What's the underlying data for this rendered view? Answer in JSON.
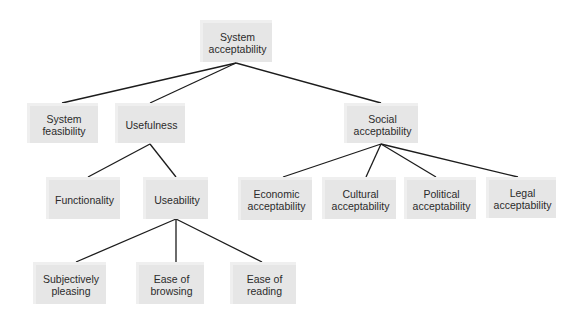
{
  "diagram": {
    "type": "tree",
    "colors": {
      "node_fill": "#e6e6e6",
      "node_highlight": "#efefef",
      "edge": "#1c1c1c",
      "text": "#2b2b2b"
    },
    "nodes": {
      "system_acceptability": {
        "label": "System\nacceptability",
        "x": 200,
        "y": 20,
        "w": 72,
        "h": 42
      },
      "system_feasibility": {
        "label": "System\nfeasibility",
        "x": 27,
        "y": 103,
        "w": 71,
        "h": 40
      },
      "usefulness": {
        "label": "Usefulness",
        "x": 115,
        "y": 103,
        "w": 70,
        "h": 40
      },
      "social_acceptability": {
        "label": "Social\nacceptability",
        "x": 344,
        "y": 103,
        "w": 74,
        "h": 40
      },
      "functionality": {
        "label": "Functionality",
        "x": 46,
        "y": 177,
        "w": 74,
        "h": 42
      },
      "useability": {
        "label": "Useability",
        "x": 143,
        "y": 177,
        "w": 65,
        "h": 42
      },
      "economic_acceptability": {
        "label": "Economic\nacceptability",
        "x": 238,
        "y": 177,
        "w": 74,
        "h": 43
      },
      "cultural_acceptability": {
        "label": "Cultural\nacceptability",
        "x": 322,
        "y": 177,
        "w": 74,
        "h": 42
      },
      "political_acceptability": {
        "label": "Political\nacceptability",
        "x": 404,
        "y": 177,
        "w": 72,
        "h": 42
      },
      "legal_acceptability": {
        "label": "Legal\nacceptability",
        "x": 486,
        "y": 177,
        "w": 70,
        "h": 41
      },
      "subjectively_pleasing": {
        "label": "Subjectively\npleasing",
        "x": 33,
        "y": 262,
        "w": 73,
        "h": 42
      },
      "ease_of_browsing": {
        "label": "Ease of\nbrowsing",
        "x": 136,
        "y": 262,
        "w": 68,
        "h": 42
      },
      "ease_of_reading": {
        "label": "Ease of\nreading",
        "x": 230,
        "y": 262,
        "w": 66,
        "h": 42
      }
    },
    "edges": [
      {
        "from": "system_acceptability",
        "to": "system_feasibility"
      },
      {
        "from": "system_acceptability",
        "to": "usefulness"
      },
      {
        "from": "system_acceptability",
        "to": "social_acceptability"
      },
      {
        "from": "usefulness",
        "to": "functionality"
      },
      {
        "from": "usefulness",
        "to": "useability"
      },
      {
        "from": "useability",
        "to": "subjectively_pleasing"
      },
      {
        "from": "useability",
        "to": "ease_of_browsing"
      },
      {
        "from": "useability",
        "to": "ease_of_reading"
      },
      {
        "from": "social_acceptability",
        "to": "economic_acceptability"
      },
      {
        "from": "social_acceptability",
        "to": "cultural_acceptability"
      },
      {
        "from": "social_acceptability",
        "to": "political_acceptability"
      },
      {
        "from": "social_acceptability",
        "to": "legal_acceptability"
      }
    ]
  }
}
